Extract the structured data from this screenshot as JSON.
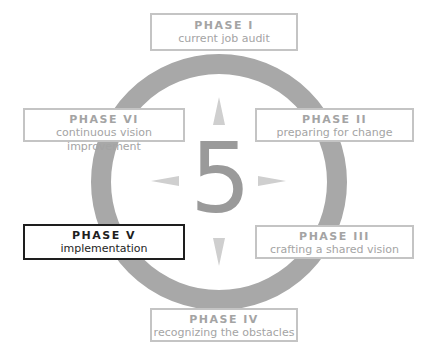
{
  "diagram": {
    "center_number": "5",
    "ring_color": "#a8a8a8",
    "arrow_color": "#cfcfcf",
    "active_phase_index": 4,
    "phases": [
      {
        "title": "PHASE I",
        "subtitle": "current job audit",
        "position": "top"
      },
      {
        "title": "PHASE II",
        "subtitle": "preparing for change",
        "position": "upper-right"
      },
      {
        "title": "PHASE III",
        "subtitle": "crafting a shared vision",
        "position": "lower-right"
      },
      {
        "title": "PHASE IV",
        "subtitle": "recognizing the obstacles",
        "position": "bottom"
      },
      {
        "title": "PHASE V",
        "subtitle": "implementation",
        "position": "lower-left",
        "highlighted": true
      },
      {
        "title": "PHASE VI",
        "subtitle": "continuous vision improvement",
        "position": "upper-left"
      }
    ],
    "arrows": [
      "up-arrow",
      "right-arrow",
      "down-arrow",
      "left-arrow"
    ],
    "colors": {
      "inactive_text": "#a4a4a4",
      "inactive_border": "#c4c4c4",
      "active_text": "#1e1e1e",
      "active_border": "#1e1e1e"
    }
  }
}
